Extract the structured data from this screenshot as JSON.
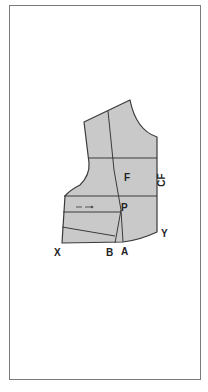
{
  "diagram": {
    "type": "bodice-front-pattern",
    "fill_color": "#c9c9c9",
    "line_color": "#3a3a3a",
    "labels": {
      "front": "F",
      "center_front": "CF",
      "point_p": "P",
      "point_x": "X",
      "point_b": "B",
      "point_a": "A",
      "point_y": "Y"
    },
    "grainline_arrow": "dashed-arrow"
  }
}
